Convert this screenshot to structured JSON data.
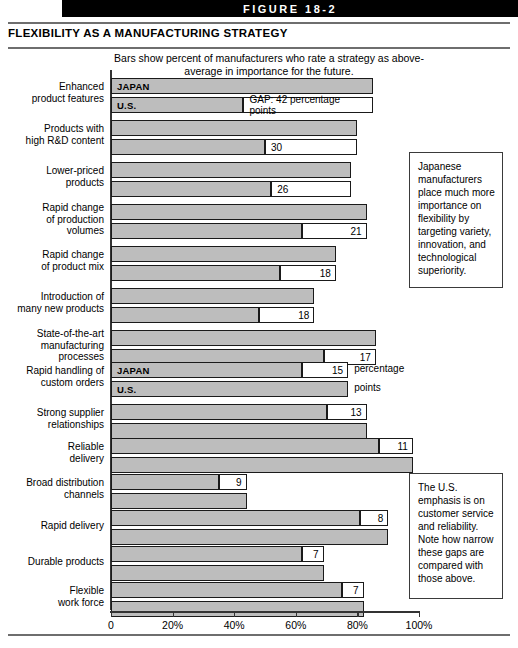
{
  "banner": {
    "label": "FIGURE 18-2"
  },
  "title": "FLEXIBILITY AS A MANUFACTURING STRATEGY",
  "subtitle": "Bars show percent of manufacturers who rate a strategy as above-average in importance for the future.",
  "series_labels": {
    "japan": "JAPAN",
    "us": "U.S."
  },
  "first_gap_label": "GAP: 42 percentage points",
  "unit_label_line1": "percentage",
  "unit_label_line2": "points",
  "callouts": [
    {
      "name": "japan-callout",
      "text": "Japanese manufacturers place much more importance on flexibility by targeting variety, innovation, and technological superiority."
    },
    {
      "name": "us-callout",
      "text": "The U.S. emphasis is on customer service and reliability. Note how narrow these gaps are compared with those above."
    }
  ],
  "chart_data": {
    "type": "bar",
    "title": "FLEXIBILITY AS A MANUFACTURING STRATEGY",
    "subtitle": "Bars show percent of manufacturers who rate a strategy as above-average in importance for the future.",
    "xlabel": "",
    "ylabel": "",
    "xlim": [
      0,
      100
    ],
    "xticks": [
      0,
      20,
      40,
      60,
      80,
      100
    ],
    "xticklabels": [
      "0",
      "20%",
      "40%",
      "60%",
      "80%",
      "100%"
    ],
    "grid": false,
    "legend": [
      "JAPAN",
      "U.S."
    ],
    "legend_position": "inline-first-bar",
    "value_unit": "percentage points",
    "groups": [
      {
        "label_lines": [
          "Enhanced",
          "product features"
        ],
        "japan": 85,
        "us": 43,
        "gap": 42,
        "gap_text": "GAP: 42 percentage points",
        "leader": "japan",
        "show_country_labels": true
      },
      {
        "label_lines": [
          "Products with",
          "high R&D content"
        ],
        "japan": 80,
        "us": 50,
        "gap": 30,
        "gap_text": "30",
        "leader": "japan",
        "show_country_labels": false
      },
      {
        "label_lines": [
          "Lower-priced",
          "products"
        ],
        "japan": 78,
        "us": 52,
        "gap": 26,
        "gap_text": "26",
        "leader": "japan",
        "show_country_labels": false
      },
      {
        "label_lines": [
          "Rapid change",
          "of production",
          "volumes"
        ],
        "japan": 83,
        "us": 62,
        "gap": 21,
        "gap_text": "21",
        "leader": "japan",
        "show_country_labels": false
      },
      {
        "label_lines": [
          "Rapid change",
          "of product mix"
        ],
        "japan": 73,
        "us": 55,
        "gap": 18,
        "gap_text": "18",
        "leader": "japan",
        "show_country_labels": false
      },
      {
        "label_lines": [
          "Introduction of",
          "many new products"
        ],
        "japan": 66,
        "us": 48,
        "gap": 18,
        "gap_text": "18",
        "leader": "japan",
        "show_country_labels": false
      },
      {
        "label_lines": [
          "State-of-the-art",
          "manufacturing",
          "processes"
        ],
        "japan": 86,
        "us": 69,
        "gap": 17,
        "gap_text": "17",
        "leader": "japan",
        "show_country_labels": false
      },
      {
        "label_lines": [
          "Rapid handling of",
          "custom orders"
        ],
        "japan": 62,
        "us": 77,
        "gap": 15,
        "gap_text": "15",
        "leader": "us",
        "show_country_labels": true
      },
      {
        "label_lines": [
          "Strong supplier",
          "relationships"
        ],
        "japan": 70,
        "us": 83,
        "gap": 13,
        "gap_text": "13",
        "leader": "us",
        "show_country_labels": false
      },
      {
        "label_lines": [
          "Reliable",
          "delivery"
        ],
        "japan": 87,
        "us": 98,
        "gap": 11,
        "gap_text": "11",
        "leader": "us",
        "show_country_labels": false
      },
      {
        "label_lines": [
          "Broad distribution",
          "channels"
        ],
        "japan": 35,
        "us": 44,
        "gap": 9,
        "gap_text": "9",
        "leader": "us",
        "show_country_labels": false
      },
      {
        "label_lines": [
          "Rapid delivery"
        ],
        "japan": 81,
        "us": 90,
        "gap": 8,
        "gap_text": "8",
        "leader": "us",
        "show_country_labels": false
      },
      {
        "label_lines": [
          "Durable products"
        ],
        "japan": 62,
        "us": 69,
        "gap": 7,
        "gap_text": "7",
        "leader": "us",
        "show_country_labels": false
      },
      {
        "label_lines": [
          "Flexible",
          "work force"
        ],
        "japan": 75,
        "us": 82,
        "gap": 7,
        "gap_text": "7",
        "leader": "us",
        "show_country_labels": false
      }
    ]
  }
}
